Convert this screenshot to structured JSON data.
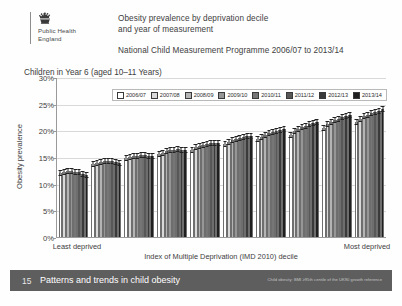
{
  "header": {
    "logo_line1": "Public Health",
    "logo_line2": "England",
    "logo_icon": "royal-crown-icon",
    "title_line1": "Obesity prevalence by deprivation decile",
    "title_line2": "and year of measurement",
    "subtitle": "National Child Measurement Programme 2006/07 to 2013/14"
  },
  "chart_caption": "Children in Year 6 (aged 10–11 Years)",
  "footer": {
    "page_number": "15",
    "title": "Patterns and trends in child obesity",
    "source_note": "Child obesity: BMI ≥95th centile of the UK90 growth reference"
  },
  "chart_data": {
    "type": "bar",
    "title": "Obesity prevalence by deprivation decile and year of measurement",
    "subtitle": "National Child Measurement Programme 2006/07 to 2013/14",
    "xlabel": "Index of Multiple Deprivation (IMD 2010) decile",
    "ylabel": "Obesity prevalence",
    "xlabel_left": "Least deprived",
    "xlabel_right": "Most deprived",
    "ylim": [
      0,
      30
    ],
    "ytick_labels": [
      "0%",
      "5%",
      "10%",
      "15%",
      "20%",
      "25%",
      "30%"
    ],
    "ytick_values": [
      0,
      5,
      10,
      15,
      20,
      25,
      30
    ],
    "grid": true,
    "legend_position": "top",
    "error_bars": true,
    "categories": [
      "1",
      "2",
      "3",
      "4",
      "5",
      "6",
      "7",
      "8",
      "9",
      "10"
    ],
    "series": [
      {
        "name": "2006/07",
        "color": "#ffffff",
        "values": [
          12.0,
          13.6,
          14.8,
          15.6,
          16.3,
          17.4,
          18.4,
          19.2,
          20.5,
          21.5
        ]
      },
      {
        "name": "2007/08",
        "color": "#d9d9d9",
        "values": [
          12.2,
          13.9,
          15.0,
          15.8,
          16.8,
          17.8,
          18.8,
          19.8,
          21.2,
          22.1
        ]
      },
      {
        "name": "2008/09",
        "color": "#b4b4b4",
        "values": [
          12.3,
          14.1,
          15.1,
          16.1,
          17.1,
          18.1,
          19.1,
          20.3,
          21.6,
          22.6
        ]
      },
      {
        "name": "2009/10",
        "color": "#969696",
        "values": [
          12.3,
          14.3,
          15.2,
          16.3,
          17.3,
          18.4,
          19.5,
          20.7,
          21.9,
          22.9
        ]
      },
      {
        "name": "2010/11",
        "color": "#767676",
        "values": [
          12.2,
          14.2,
          15.3,
          16.4,
          17.5,
          18.6,
          19.7,
          20.9,
          22.2,
          23.2
        ]
      },
      {
        "name": "2011/12",
        "color": "#585858",
        "values": [
          12.1,
          14.2,
          15.3,
          16.5,
          17.6,
          18.8,
          19.9,
          21.2,
          22.5,
          23.5
        ]
      },
      {
        "name": "2012/13",
        "color": "#3a3a3a",
        "values": [
          11.9,
          14.0,
          15.2,
          16.4,
          17.7,
          18.9,
          20.1,
          21.4,
          22.7,
          23.7
        ]
      },
      {
        "name": "2013/14",
        "color": "#1f1f1f",
        "values": [
          11.6,
          13.9,
          15.1,
          16.4,
          17.7,
          19.0,
          20.2,
          21.6,
          22.9,
          24.0
        ]
      }
    ]
  }
}
